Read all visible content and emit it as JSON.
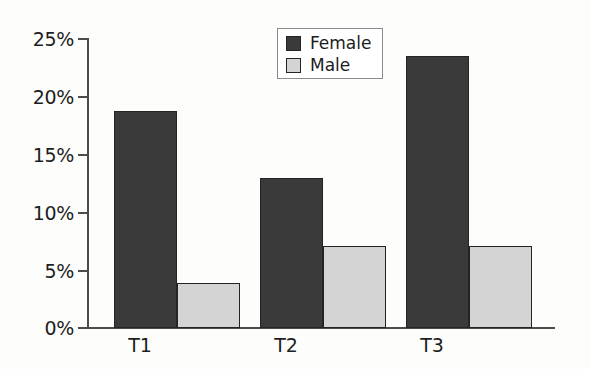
{
  "chart_data": {
    "type": "bar",
    "title": "",
    "subtitle": "",
    "xlabel": "",
    "ylabel": "",
    "categories": [
      "T1",
      "T2",
      "T3"
    ],
    "series": [
      {
        "name": "Female",
        "values": [
          18.8,
          13.0,
          23.5
        ],
        "color": "#3a3a3a"
      },
      {
        "name": "Male",
        "values": [
          3.9,
          7.1,
          7.1
        ],
        "color": "#d4d4d4"
      }
    ],
    "ylim": [
      0,
      25
    ],
    "ytick_values": [
      0,
      5,
      10,
      15,
      20,
      25
    ],
    "ytick_labels": [
      "0%",
      "5%",
      "10%",
      "15%",
      "20%",
      "25%"
    ],
    "grid": false,
    "legend_position": "top-center-right",
    "value_suffix": "%"
  },
  "legend": {
    "entries": [
      {
        "label": "Female",
        "swatch": "dark-swatch-icon"
      },
      {
        "label": "Male",
        "swatch": "light-swatch-icon"
      }
    ]
  },
  "axes": {
    "y_labels": [
      "25%",
      "20%",
      "15%",
      "10%",
      "5%",
      "0%"
    ],
    "x_labels": [
      "T1",
      "T2",
      "T3"
    ]
  },
  "colors": {
    "female_fill": "#3a3a3a",
    "male_fill": "#d4d4d4",
    "bar_outline": "#242424",
    "axis": "#4c4c4c",
    "text": "#1d1d1d",
    "background": "#fdfdfc",
    "legend_border": "#8c8c8c"
  }
}
